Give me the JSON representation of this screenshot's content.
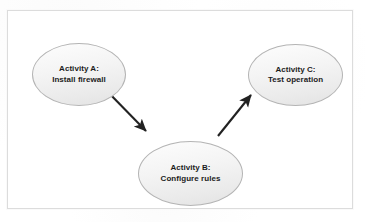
{
  "diagram": {
    "frame": {
      "border_color": "#dcdcdc",
      "background_color": "#ffffff"
    },
    "node_style": {
      "shape": "ellipse",
      "fill_color": "#eeeeee",
      "border_color": "#b4b4b4",
      "text_color": "#1c1c1c"
    },
    "edge_style": {
      "line_color": "#222222",
      "arrowhead": "solid-triangle"
    },
    "nodes": [
      {
        "id": "activity-a",
        "title": "Activity A:",
        "subtitle": "Install firewall",
        "label": "Activity A:\nInstall firewall"
      },
      {
        "id": "activity-b",
        "title": "Activity B:",
        "subtitle": "Configure rules",
        "label": "Activity B:\nConfigure rules"
      },
      {
        "id": "activity-c",
        "title": "Activity C:",
        "subtitle": "Test operation",
        "label": "Activity C:\nTest operation"
      }
    ],
    "edges": [
      {
        "id": "edge-a-b",
        "from": "activity-a",
        "to": "activity-b",
        "label": ""
      },
      {
        "id": "edge-b-c",
        "from": "activity-b",
        "to": "activity-c",
        "label": ""
      }
    ]
  }
}
